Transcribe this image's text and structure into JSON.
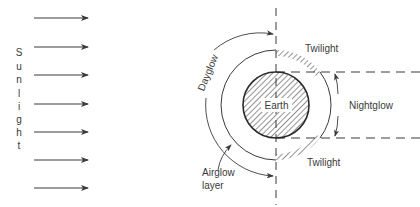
{
  "diagram": {
    "sunlight_label": "Sunlight",
    "sunlight_letters": [
      "S",
      "u",
      "n",
      "l",
      "i",
      "g",
      "h",
      "t"
    ],
    "sun_arrows_y": [
      18,
      47,
      75,
      104,
      132,
      160,
      188
    ],
    "earth_label": "Earth",
    "dayglow_label": "Dayglow",
    "nightglow_label": "Nightglow",
    "twilight_top_label": "Twilight",
    "twilight_bottom_label": "Twilight",
    "airglow_label_line1": "Airglow",
    "airglow_label_line2": "layer",
    "colors": {
      "line": "#3a3a3a",
      "text": "#3a3a3a",
      "background": "#ffffff"
    }
  }
}
